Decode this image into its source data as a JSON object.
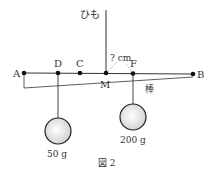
{
  "figure": {
    "caption": "図 2",
    "string_label": "ひも",
    "rod_label": "棒",
    "unknown_distance": "? cm",
    "points": [
      {
        "id": "A",
        "label": "A",
        "x": 24
      },
      {
        "id": "D",
        "label": "D",
        "x": 58
      },
      {
        "id": "C",
        "label": "C",
        "x": 80
      },
      {
        "id": "M",
        "label": "M",
        "x": 106
      },
      {
        "id": "F",
        "label": "F",
        "x": 133
      },
      {
        "id": "B",
        "label": "B",
        "x": 193
      }
    ],
    "weights": [
      {
        "hangs_from": "D",
        "label": "50 g"
      },
      {
        "hangs_from": "F",
        "label": "200 g"
      }
    ],
    "colors": {
      "line": "#333333",
      "dot": "#111111",
      "dotted": "#999999",
      "ball_edge": "#222222",
      "ball_fill_center": "#ffffff",
      "ball_fill_edge": "#cfcfcf"
    }
  }
}
